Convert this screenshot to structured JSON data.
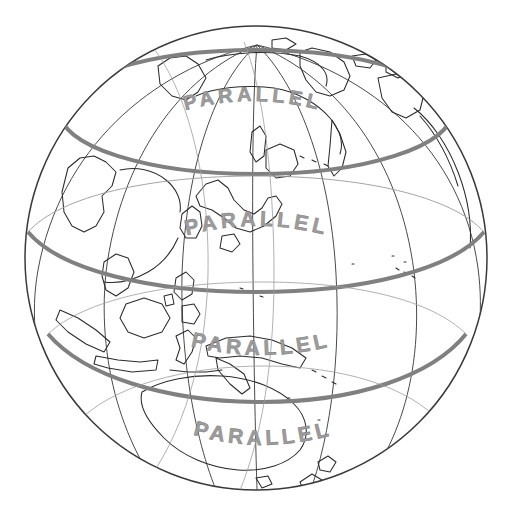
{
  "figure": {
    "kind": "globe-diagram",
    "background_color": "#ffffff",
    "outline_color": "#333333",
    "graticule_color": "#555555",
    "coastline_color": "#2b2b2b",
    "parallel_band_color": "#808080",
    "label_color": "#9a9a9a",
    "label_stroke_color": "#6f6f6f"
  },
  "globe": {
    "center_x": 256,
    "center_y": 258,
    "radius_x": 231,
    "radius_y": 232,
    "pole_x": 257,
    "pole_y": 45
  },
  "parallels": [
    {
      "index": 1,
      "label": "PARALLEL",
      "band_y": 112,
      "band_rx": 196,
      "band_ry": 62,
      "label_x": 252,
      "label_y": 105,
      "label_size": 20,
      "label_arc": -14
    },
    {
      "index": 2,
      "label": "PARALLEL",
      "band_y": 232,
      "band_rx": 228,
      "band_ry": 58,
      "label_x": 256,
      "label_y": 232,
      "label_size": 21,
      "label_arc": -11
    },
    {
      "index": 3,
      "label": "PARALLEL",
      "band_y": 348,
      "band_rx": 228,
      "band_ry": 56,
      "label_x": 260,
      "label_y": 354,
      "label_size": 21,
      "label_arc": 9
    },
    {
      "index": 4,
      "label": "PARALLEL",
      "band_y": 443,
      "band_rx": 196,
      "band_ry": 58,
      "label_x": 262,
      "label_y": 444,
      "label_size": 21,
      "label_arc": 13
    }
  ],
  "meridians": {
    "count": 6,
    "description": "lines of longitude converging at the north pole"
  },
  "landmasses": [
    "Eurasia",
    "Siberia",
    "Japan",
    "Korea",
    "China",
    "Southeast Asia",
    "Philippines",
    "Indonesia",
    "New Guinea",
    "Australia",
    "New Zealand",
    "Greenland",
    "Alaska"
  ]
}
